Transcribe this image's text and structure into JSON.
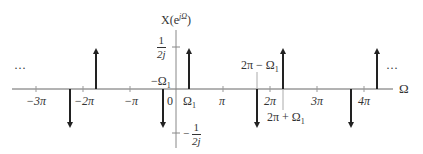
{
  "diagram": {
    "y_label_base": "X(e",
    "y_label_sup": "jΩ",
    "y_label_close": ")",
    "x_axis_label": "Ω",
    "ellipsis_left": "···",
    "ellipsis_right": "···",
    "origin_label": "0",
    "x_ticks": [
      {
        "label": "−3π",
        "x": 36
      },
      {
        "label": "−2π",
        "x": 83
      },
      {
        "label": "−π",
        "x": 130
      },
      {
        "label": "π",
        "x": 223
      },
      {
        "label": "2π",
        "x": 270
      },
      {
        "label": "3π",
        "x": 317
      },
      {
        "label": "4π",
        "x": 364
      }
    ],
    "y_ticks": {
      "positive": {
        "numerator": "1",
        "denominator": "2j"
      },
      "negative": {
        "sign": "−",
        "numerator": "1",
        "denominator": "2j"
      }
    },
    "impulse_labels": {
      "neg_omega1": "−Ω",
      "neg_omega1_sub": "1",
      "omega1": "Ω",
      "omega1_sub": "1",
      "two_pi_minus": "2π − Ω",
      "two_pi_minus_sub": "1",
      "two_pi_plus": "2π + Ω",
      "two_pi_plus_sub": "1"
    },
    "impulses": [
      {
        "position": "-2π+Ω1",
        "amplitude": "1/2j",
        "direction": "up"
      },
      {
        "position": "-2π-Ω1",
        "amplitude": "-1/2j",
        "direction": "down"
      },
      {
        "position": "Ω1",
        "amplitude": "1/2j",
        "direction": "up"
      },
      {
        "position": "-Ω1",
        "amplitude": "-1/2j",
        "direction": "down"
      },
      {
        "position": "2π+Ω1",
        "amplitude": "1/2j",
        "direction": "up"
      },
      {
        "position": "2π-Ω1",
        "amplitude": "-1/2j",
        "direction": "down"
      },
      {
        "position": "4π+Ω1",
        "amplitude": "1/2j",
        "direction": "up"
      },
      {
        "position": "4π-Ω1",
        "amplitude": "-1/2j",
        "direction": "down"
      }
    ],
    "colors": {
      "axis": "#666666",
      "impulse": "#222222",
      "text": "#333333"
    }
  }
}
